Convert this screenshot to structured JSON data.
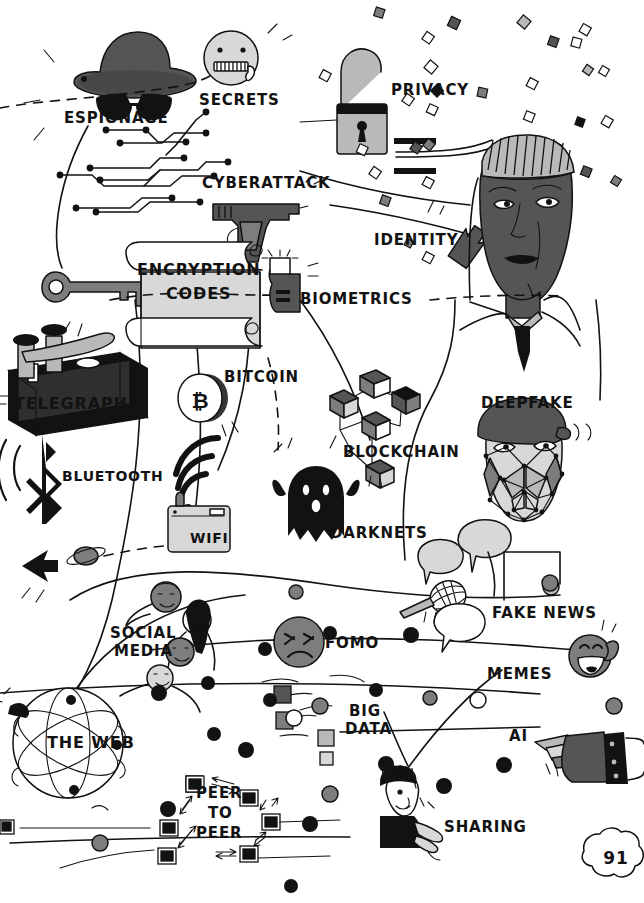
{
  "page": {
    "number": "91",
    "kind": "illustrated-infographic-page",
    "background": "#ffffff",
    "ink": "#121212"
  },
  "palette": {
    "ink": "#121212",
    "dark_gray": "#555555",
    "mid_gray": "#7d7d7d",
    "light_gray": "#b9b9b9",
    "pale_gray": "#d8d8d8",
    "paper": "#ffffff",
    "scroll_fill": "#dcdcdc"
  },
  "labels": [
    {
      "id": "espionage",
      "text": "ESPIONAGE",
      "x": 64,
      "y": 111,
      "size": 15,
      "align": "left"
    },
    {
      "id": "secrets",
      "text": "SECRETS",
      "x": 199,
      "y": 93,
      "size": 15,
      "align": "left"
    },
    {
      "id": "privacy",
      "text": "PRIVACY",
      "x": 391,
      "y": 83,
      "size": 15,
      "align": "left"
    },
    {
      "id": "cyberattack",
      "text": "CYBERATTACK",
      "x": 202,
      "y": 176,
      "size": 15,
      "align": "left"
    },
    {
      "id": "identity",
      "text": "IDENTITY",
      "x": 374,
      "y": 233,
      "size": 15,
      "align": "left"
    },
    {
      "id": "encryption",
      "text": "ENCRYPTION",
      "x": 137,
      "y": 262,
      "size": 16,
      "align": "left"
    },
    {
      "id": "codes",
      "text": "CODES",
      "x": 166,
      "y": 286,
      "size": 16,
      "align": "left"
    },
    {
      "id": "biometrics",
      "text": "BIOMETRICS",
      "x": 300,
      "y": 292,
      "size": 15,
      "align": "left"
    },
    {
      "id": "telegraph",
      "text": "TELEGRAPH",
      "x": 14,
      "y": 396,
      "size": 16,
      "align": "left"
    },
    {
      "id": "bitcoin",
      "text": "BITCOIN",
      "x": 224,
      "y": 370,
      "size": 15,
      "align": "left"
    },
    {
      "id": "blockchain",
      "text": "BLOCKCHAIN",
      "x": 343,
      "y": 445,
      "size": 15,
      "align": "left"
    },
    {
      "id": "deepfake",
      "text": "DEEPFAKE",
      "x": 481,
      "y": 396,
      "size": 15,
      "align": "left"
    },
    {
      "id": "bluetooth",
      "text": "BLUETOOTH",
      "x": 62,
      "y": 469,
      "size": 14,
      "align": "left"
    },
    {
      "id": "wifi",
      "text": "WIFI",
      "x": 190,
      "y": 531,
      "size": 14,
      "align": "left"
    },
    {
      "id": "darknets",
      "text": "DARKNETS",
      "x": 330,
      "y": 526,
      "size": 15,
      "align": "left"
    },
    {
      "id": "fakenews",
      "text": "FAKE NEWS",
      "x": 492,
      "y": 606,
      "size": 15,
      "align": "left"
    },
    {
      "id": "socialmedia1",
      "text": "SOCIAL",
      "x": 110,
      "y": 626,
      "size": 15,
      "align": "left"
    },
    {
      "id": "socialmedia2",
      "text": "MEDIA",
      "x": 114,
      "y": 644,
      "size": 15,
      "align": "left"
    },
    {
      "id": "fomo",
      "text": "FOMO",
      "x": 325,
      "y": 636,
      "size": 15,
      "align": "left"
    },
    {
      "id": "memes",
      "text": "MEMES",
      "x": 487,
      "y": 667,
      "size": 15,
      "align": "left"
    },
    {
      "id": "bigdata1",
      "text": "BIG",
      "x": 349,
      "y": 704,
      "size": 15,
      "align": "left"
    },
    {
      "id": "bigdata2",
      "text": "DATA",
      "x": 345,
      "y": 722,
      "size": 15,
      "align": "left"
    },
    {
      "id": "ai",
      "text": "AI",
      "x": 509,
      "y": 729,
      "size": 15,
      "align": "left"
    },
    {
      "id": "theweb",
      "text": "THE WEB",
      "x": 47,
      "y": 735,
      "size": 16,
      "align": "left"
    },
    {
      "id": "peer1",
      "text": "PEER",
      "x": 196,
      "y": 786,
      "size": 15,
      "align": "left"
    },
    {
      "id": "to",
      "text": "TO",
      "x": 208,
      "y": 806,
      "size": 15,
      "align": "left"
    },
    {
      "id": "peer2",
      "text": "PEER",
      "x": 196,
      "y": 826,
      "size": 15,
      "align": "left"
    },
    {
      "id": "sharing",
      "text": "SHARING",
      "x": 444,
      "y": 820,
      "size": 15,
      "align": "left"
    }
  ],
  "icons": [
    {
      "id": "spy-hat-sunglasses-icon",
      "label_for": "espionage"
    },
    {
      "id": "zipper-mouth-face-icon",
      "label_for": "secrets"
    },
    {
      "id": "open-padlock-icon",
      "label_for": "privacy"
    },
    {
      "id": "handgun-icon",
      "label_for": "cyberattack"
    },
    {
      "id": "arrow-icon",
      "label_for": "identity"
    },
    {
      "id": "portrait-head-icon",
      "label_for": "identity"
    },
    {
      "id": "paper-scroll-icon",
      "label_for": "encryption"
    },
    {
      "id": "thumbprint-icon",
      "label_for": "biometrics"
    },
    {
      "id": "telegraph-key-icon",
      "label_for": "telegraph"
    },
    {
      "id": "bitcoin-coin-icon",
      "label_for": "bitcoin"
    },
    {
      "id": "cube-network-icon",
      "label_for": "blockchain"
    },
    {
      "id": "masked-face-mesh-icon",
      "label_for": "deepfake"
    },
    {
      "id": "bluetooth-glyph-icon",
      "label_for": "bluetooth"
    },
    {
      "id": "wifi-router-icon",
      "label_for": "wifi"
    },
    {
      "id": "ghost-icon",
      "label_for": "darknets"
    },
    {
      "id": "microphone-icon",
      "label_for": "fakenews"
    },
    {
      "id": "speech-bubble-icon",
      "label_for": "fakenews"
    },
    {
      "id": "people-chain-icon",
      "label_for": "socialmedia1"
    },
    {
      "id": "confounded-face-icon",
      "label_for": "fomo"
    },
    {
      "id": "laughing-face-icon",
      "label_for": "memes"
    },
    {
      "id": "dots-and-squares-icon",
      "label_for": "bigdata1"
    },
    {
      "id": "robot-hand-pointing-icon",
      "label_for": "ai"
    },
    {
      "id": "wireframe-globe-icon",
      "label_for": "theweb"
    },
    {
      "id": "monitor-ring-icon",
      "label_for": "peer1"
    },
    {
      "id": "person-offering-icon",
      "label_for": "sharing"
    },
    {
      "id": "circuit-traces-icon",
      "label_for": "espionage"
    },
    {
      "id": "old-key-icon",
      "label_for": "encryption"
    },
    {
      "id": "saturn-planet-icon",
      "label_for": "bluetooth"
    },
    {
      "id": "confetti-diamonds-icon",
      "label_for": "privacy"
    },
    {
      "id": "page-number-cloud-icon",
      "label_for": "page-number"
    }
  ]
}
